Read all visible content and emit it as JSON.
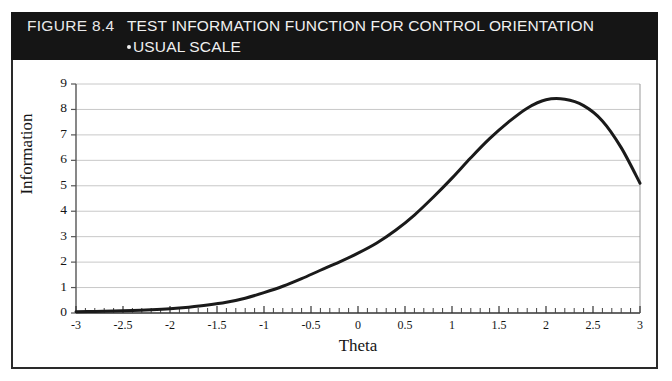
{
  "figure": {
    "number_label": "FIGURE 8.4",
    "title": "TEST INFORMATION FUNCTION FOR CONTROL ORIENTATION",
    "subtitle": "USUAL SCALE",
    "banner_background": "#151515",
    "banner_text_color": "#f0f0f0",
    "border_color": "#2a2a2a",
    "plot_background": "#ffffff"
  },
  "chart_data": {
    "type": "line",
    "title": "TEST INFORMATION FUNCTION FOR CONTROL ORIENTATION",
    "subtitle": "USUAL SCALE",
    "xlabel": "Theta",
    "ylabel": "Information",
    "xlim": [
      -3,
      3
    ],
    "ylim": [
      0,
      9
    ],
    "grid": "horizontal",
    "grid_color": "#c8c8c8",
    "legend": null,
    "line_color": "#1a1a1a",
    "line_width": 3,
    "xticks": [
      -3,
      -2.5,
      -2,
      -1.5,
      -1,
      -0.5,
      0,
      0.5,
      1,
      1.5,
      2,
      2.5,
      3
    ],
    "xtick_labels": [
      "-3",
      "-2.5",
      "-2",
      "-1.5",
      "-1",
      "-0.5",
      "0",
      "0.5",
      "1",
      "1.5",
      "2",
      "2.5",
      "3"
    ],
    "yticks": [
      0,
      1,
      2,
      3,
      4,
      5,
      6,
      7,
      8,
      9
    ],
    "ytick_labels": [
      "0",
      "1",
      "2",
      "3",
      "4",
      "5",
      "6",
      "7",
      "8",
      "9"
    ],
    "minor_xticks_per_interval": 5,
    "series": [
      {
        "name": "Test Information",
        "x": [
          -3.0,
          -2.8,
          -2.6,
          -2.4,
          -2.2,
          -2.0,
          -1.8,
          -1.6,
          -1.4,
          -1.2,
          -1.0,
          -0.8,
          -0.6,
          -0.4,
          -0.2,
          0.0,
          0.2,
          0.4,
          0.6,
          0.8,
          1.0,
          1.2,
          1.4,
          1.6,
          1.8,
          2.0,
          2.2,
          2.4,
          2.6,
          2.8,
          3.0
        ],
        "y": [
          0.05,
          0.06,
          0.08,
          0.1,
          0.13,
          0.17,
          0.23,
          0.31,
          0.42,
          0.58,
          0.8,
          1.05,
          1.35,
          1.68,
          2.0,
          2.35,
          2.75,
          3.25,
          3.85,
          4.55,
          5.3,
          6.1,
          6.85,
          7.5,
          8.05,
          8.38,
          8.4,
          8.15,
          7.55,
          6.5,
          5.1
        ]
      }
    ],
    "annotations": []
  }
}
